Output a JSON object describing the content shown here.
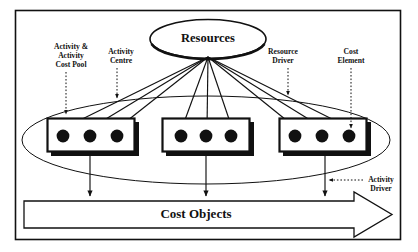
{
  "diagram": {
    "title_node": {
      "label": "Resources",
      "shape": "ellipse"
    },
    "output_node": {
      "label": "Cost Objects",
      "shape": "block-arrow-right"
    },
    "callouts": [
      {
        "id": "activity-cost-pool",
        "label_line1": "Activity &",
        "label_line2": "Activity",
        "label_line3": "Cost Pool"
      },
      {
        "id": "activity-centre",
        "label_line1": "Activity",
        "label_line2": "Centre"
      },
      {
        "id": "resource-driver",
        "label_line1": "Resource",
        "label_line2": "Driver"
      },
      {
        "id": "cost-element",
        "label_line1": "Cost",
        "label_line2": "Element"
      },
      {
        "id": "activity-driver",
        "label_line1": "Activity",
        "label_line2": "Driver"
      }
    ],
    "activity_cost_pools": [
      {
        "id": "pool-left",
        "cost_elements": 3
      },
      {
        "id": "pool-middle",
        "cost_elements": 3
      },
      {
        "id": "pool-right",
        "cost_elements": 3
      }
    ],
    "resource_driver_arrows": 9,
    "activity_driver_arrows": 3,
    "colors": {
      "ink": "#111111",
      "background": "#ffffff"
    }
  }
}
